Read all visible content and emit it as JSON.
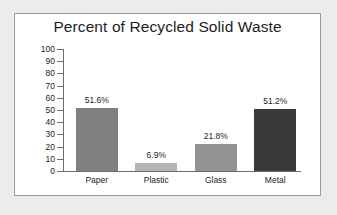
{
  "page": {
    "background_color": "#ececed",
    "panel_background_color": "#ffffff",
    "panel_border_color": "#9a9a9b"
  },
  "chart_data": {
    "type": "bar",
    "title": "Percent of Recycled Solid Waste",
    "xlabel": "",
    "ylabel": "",
    "ylim": [
      0,
      100
    ],
    "ytick_step": 10,
    "grid": false,
    "legend": "none",
    "categories": [
      "Paper",
      "Plastic",
      "Glass",
      "Metal"
    ],
    "values": [
      51.6,
      6.9,
      21.8,
      51.2
    ],
    "data_labels": [
      "51.6%",
      "6.9%",
      "21.8%",
      "51.2%"
    ],
    "bar_colors": [
      "#808080",
      "#b4b4b4",
      "#949494",
      "#3a3a3a"
    ],
    "y_tick_labels": [
      "100",
      "90",
      "80",
      "70",
      "60",
      "50",
      "40",
      "30",
      "20",
      "10",
      "0"
    ],
    "axis_color": "#6d6d6d",
    "text_color": "#1d1d1d"
  }
}
